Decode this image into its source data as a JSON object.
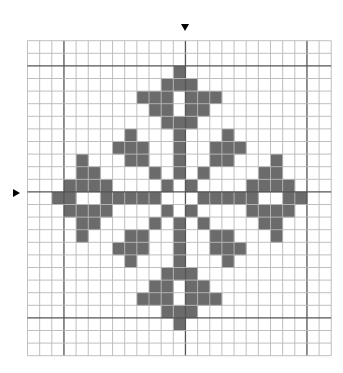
{
  "pattern": {
    "title": "Cross-stitch snowflake cross pattern",
    "cols": 25,
    "rows": 25,
    "origin": {
      "x": 27.5,
      "y": 40.7
    },
    "cell": {
      "w": 12.15,
      "h": 12.6
    },
    "major_every": 10,
    "major_col_offset": 3,
    "major_row_offset": 2,
    "colors": {
      "fill": "#6b6b6b",
      "minor_line": "#b8b8b8",
      "major_line": "#555555",
      "background": "#ffffff",
      "marker": "#000000"
    },
    "center_markers": {
      "top": {
        "x": 185.5,
        "y": 28
      },
      "left": {
        "x": 13,
        "y": 192
      }
    },
    "filled": [
      [
        2,
        [
          12
        ]
      ],
      [
        3,
        [
          11,
          12,
          13
        ]
      ],
      [
        4,
        [
          9,
          10,
          11,
          13,
          14,
          15
        ]
      ],
      [
        5,
        [
          10,
          11,
          13,
          14
        ]
      ],
      [
        6,
        [
          11,
          12,
          13
        ]
      ],
      [
        7,
        [
          8,
          12,
          16
        ]
      ],
      [
        8,
        [
          7,
          8,
          9,
          12,
          15,
          16,
          17
        ]
      ],
      [
        9,
        [
          4,
          8,
          9,
          12,
          15,
          16,
          20
        ]
      ],
      [
        10,
        [
          4,
          5,
          10,
          12,
          14,
          19,
          20
        ]
      ],
      [
        11,
        [
          3,
          4,
          5,
          6,
          11,
          13,
          18,
          19,
          20,
          21
        ]
      ],
      [
        12,
        [
          2,
          3,
          6,
          7,
          8,
          9,
          10,
          14,
          15,
          16,
          17,
          18,
          21,
          22
        ]
      ],
      [
        13,
        [
          3,
          4,
          5,
          6,
          11,
          13,
          18,
          19,
          20,
          21
        ]
      ],
      [
        14,
        [
          4,
          5,
          10,
          12,
          14,
          19,
          20
        ]
      ],
      [
        15,
        [
          4,
          8,
          9,
          12,
          15,
          16,
          20
        ]
      ],
      [
        16,
        [
          7,
          8,
          9,
          12,
          15,
          16,
          17
        ]
      ],
      [
        17,
        [
          8,
          12,
          16
        ]
      ],
      [
        18,
        [
          11,
          12,
          13
        ]
      ],
      [
        19,
        [
          10,
          11,
          13,
          14
        ]
      ],
      [
        20,
        [
          9,
          10,
          11,
          13,
          14,
          15
        ]
      ],
      [
        21,
        [
          11,
          12,
          13
        ]
      ],
      [
        22,
        [
          12
        ]
      ]
    ]
  }
}
